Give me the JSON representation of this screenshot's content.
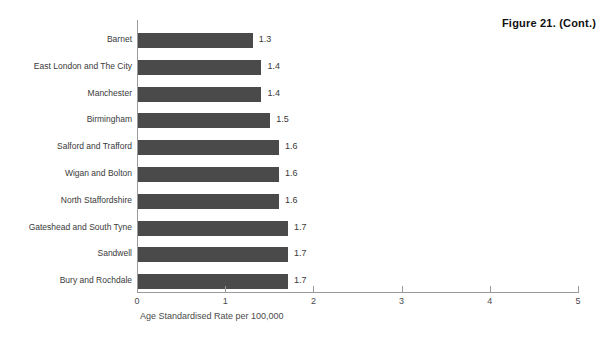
{
  "figure": {
    "title": "Figure 21. (Cont.)"
  },
  "chart_data": {
    "type": "bar",
    "orientation": "horizontal",
    "title": "Figure 21. (Cont.)",
    "xlabel": "Age Standardised Rate per 100,000",
    "ylabel": "",
    "xlim": [
      0,
      5
    ],
    "xticks": [
      "0",
      "1",
      "2",
      "3",
      "4",
      "5"
    ],
    "grid": false,
    "legend": null,
    "bar_color": "#4a4a4a",
    "axis_color": "#9a9a9a",
    "categories": [
      "Barnet",
      "East London and The City",
      "Manchester",
      "Birmingham",
      "Salford and Trafford",
      "Wigan and Bolton",
      "North Staffordshire",
      "Gateshead and South Tyne",
      "Sandwell",
      "Bury and Rochdale"
    ],
    "values": [
      1.3,
      1.4,
      1.4,
      1.5,
      1.6,
      1.6,
      1.6,
      1.7,
      1.7,
      1.7
    ],
    "value_labels": [
      "1.3",
      "1.4",
      "1.4",
      "1.5",
      "1.6",
      "1.6",
      "1.6",
      "1.7",
      "1.7",
      "1.7"
    ]
  }
}
